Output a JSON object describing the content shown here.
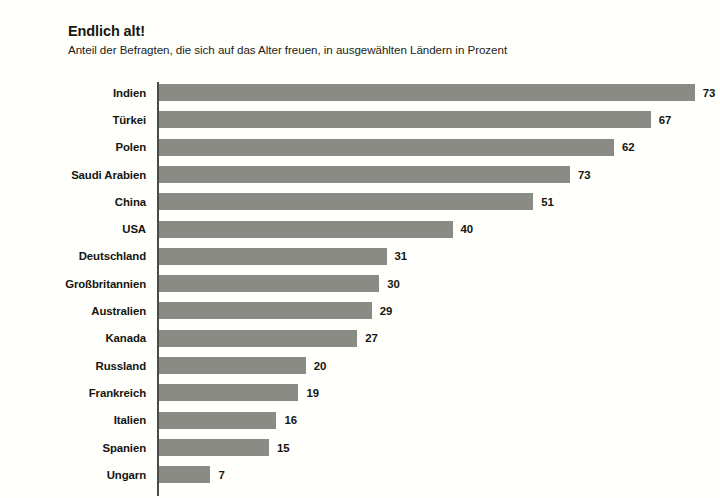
{
  "chart_data": {
    "type": "bar",
    "orientation": "horizontal",
    "title": "Endlich alt!",
    "subtitle": "Anteil der Befragten, die sich auf das Alter freuen, in ausgewählten Ländern in Prozent",
    "xlabel": "",
    "ylabel": "",
    "xlim": [
      0,
      73
    ],
    "grid": false,
    "legend": null,
    "bar_color": "#8b8b85",
    "background_color": "#fffffc",
    "categories": [
      "Indien",
      "Türkei",
      "Polen",
      "Saudi Arabien",
      "China",
      "USA",
      "Deutschland",
      "Großbritannien",
      "Australien",
      "Kanada",
      "Russland",
      "Frankreich",
      "Italien",
      "Spanien",
      "Ungarn"
    ],
    "values": [
      73,
      67,
      62,
      73,
      51,
      40,
      31,
      30,
      29,
      27,
      20,
      19,
      16,
      15,
      7
    ],
    "bar_lengths": [
      73,
      67,
      62,
      56,
      51,
      40,
      31,
      30,
      29,
      27,
      20,
      19,
      16,
      15,
      7
    ],
    "labels": [
      "73",
      "67",
      "62",
      "73",
      "51",
      "40",
      "31",
      "30",
      "29",
      "27",
      "20",
      "19",
      "16",
      "15",
      "7"
    ],
    "bars": [
      {
        "category": "Indien",
        "value": 73,
        "bar_length": 73,
        "label": "73"
      },
      {
        "category": "Türkei",
        "value": 67,
        "bar_length": 67,
        "label": "67"
      },
      {
        "category": "Polen",
        "value": 62,
        "bar_length": 62,
        "label": "62"
      },
      {
        "category": "Saudi Arabien",
        "value": 73,
        "bar_length": 56,
        "label": "73"
      },
      {
        "category": "China",
        "value": 51,
        "bar_length": 51,
        "label": "51"
      },
      {
        "category": "USA",
        "value": 40,
        "bar_length": 40,
        "label": "40"
      },
      {
        "category": "Deutschland",
        "value": 31,
        "bar_length": 31,
        "label": "31"
      },
      {
        "category": "Großbritannien",
        "value": 30,
        "bar_length": 30,
        "label": "30"
      },
      {
        "category": "Australien",
        "value": 29,
        "bar_length": 29,
        "label": "29"
      },
      {
        "category": "Kanada",
        "value": 27,
        "bar_length": 27,
        "label": "27"
      },
      {
        "category": "Russland",
        "value": 20,
        "bar_length": 20,
        "label": "20"
      },
      {
        "category": "Frankreich",
        "value": 19,
        "bar_length": 19,
        "label": "19"
      },
      {
        "category": "Italien",
        "value": 16,
        "bar_length": 16,
        "label": "16"
      },
      {
        "category": "Spanien",
        "value": 15,
        "bar_length": 15,
        "label": "15"
      },
      {
        "category": "Ungarn",
        "value": 7,
        "bar_length": 7,
        "label": "7"
      }
    ]
  }
}
